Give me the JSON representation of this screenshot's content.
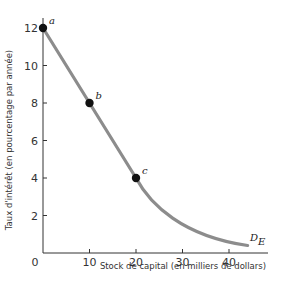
{
  "chart_data": {
    "type": "line",
    "title": "",
    "xlabel": "Stock de capital (en milliers de dollars)",
    "ylabel": "Taux d'intérêt (en pourcentage par année)",
    "xlim": [
      0,
      48
    ],
    "ylim": [
      0,
      13
    ],
    "x_ticks": [
      "0",
      "10",
      "20",
      "30",
      "40"
    ],
    "y_ticks": [
      "2",
      "4",
      "6",
      "8",
      "10",
      "12"
    ],
    "grid": false,
    "series": [
      {
        "name": "D_E",
        "label_main": "D",
        "label_sub": "E",
        "color": "#8c8c8c",
        "x": [
          0,
          10,
          20,
          25,
          30,
          35,
          40,
          44
        ],
        "y": [
          12,
          8,
          4,
          2.5,
          1.5,
          0.9,
          0.55,
          0.4
        ]
      }
    ],
    "points": [
      {
        "label": "a",
        "x": 0,
        "y": 12
      },
      {
        "label": "b",
        "x": 10,
        "y": 8
      },
      {
        "label": "c",
        "x": 20,
        "y": 4
      }
    ]
  }
}
